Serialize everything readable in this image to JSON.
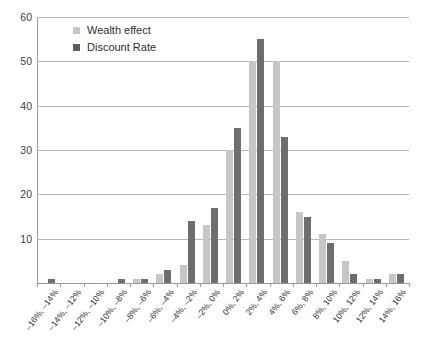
{
  "chart_data": {
    "type": "bar",
    "title": "",
    "subtitle": "",
    "xlabel": "",
    "ylabel": "",
    "ylim": [
      0,
      60
    ],
    "yticks": [
      0,
      10,
      20,
      30,
      40,
      50,
      60
    ],
    "ytick_labels": [
      "0",
      "10",
      "20",
      "30",
      "40",
      "50",
      "60"
    ],
    "grid": true,
    "legend_position": "top-left-inside",
    "categories": [
      "–16%, –14%",
      "–14%, –12%",
      "–12%, –10%",
      "–10%, –8%",
      "–8%, –6%",
      "–6%, –4%",
      "–4%, –2%",
      "–2%, 0%",
      "0%, 2%",
      "2%, 4%",
      "4%, 6%",
      "6%, 8%",
      "8%, 10%",
      "10%, 12%",
      "12%, 14%",
      "14%, 16%"
    ],
    "series": [
      {
        "name": "Wealth effect",
        "color": "#c6c6c6",
        "values": [
          0,
          0,
          0,
          0,
          1,
          2,
          4,
          13,
          30,
          50,
          50,
          16,
          11,
          5,
          1,
          2
        ]
      },
      {
        "name": "Discount Rate",
        "color": "#6e6e6e",
        "values": [
          1,
          0,
          0,
          1,
          1,
          3,
          14,
          17,
          35,
          55,
          33,
          15,
          9,
          2,
          1,
          2
        ]
      }
    ]
  },
  "legend": {
    "items": [
      {
        "label": "Wealth effect",
        "swatch": "legend-swatch-wealth"
      },
      {
        "label": "Discount Rate",
        "swatch": "legend-swatch-discount"
      }
    ]
  }
}
